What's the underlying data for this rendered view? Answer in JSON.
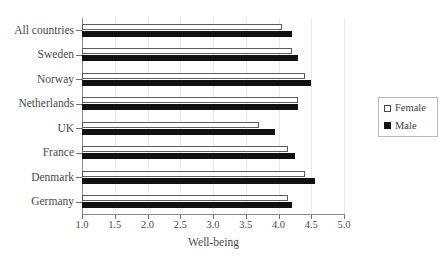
{
  "chart_data": {
    "type": "bar",
    "orientation": "horizontal",
    "title": "",
    "xlabel": "Well-being",
    "ylabel": "",
    "xlim": [
      1.0,
      5.0
    ],
    "xticks": [
      "1.0",
      "1.5",
      "2.0",
      "2.5",
      "3.0",
      "3.5",
      "4.0",
      "4.5",
      "5.0"
    ],
    "xtick_values": [
      1.0,
      1.5,
      2.0,
      2.5,
      3.0,
      3.5,
      4.0,
      4.5,
      5.0
    ],
    "grid": "vertical-light",
    "legend_position": "right-outside",
    "categories": [
      "All countries",
      "Sweden",
      "Norway",
      "Netherlands",
      "UK",
      "France",
      "Denmark",
      "Germany"
    ],
    "series": [
      {
        "name": "Female",
        "color": "#ffffff",
        "edge_color": "#5d5d5d",
        "values": [
          4.05,
          4.2,
          4.4,
          4.3,
          3.7,
          4.15,
          4.4,
          4.15
        ]
      },
      {
        "name": "Male",
        "color": "#111111",
        "edge_color": "#111111",
        "values": [
          4.2,
          4.3,
          4.5,
          4.3,
          3.95,
          4.25,
          4.55,
          4.2
        ]
      }
    ]
  },
  "legend": {
    "entries": [
      {
        "label": "Female",
        "swatch": "open-square-swatch"
      },
      {
        "label": "Male",
        "swatch": "filled-square-swatch"
      }
    ]
  },
  "axis": {
    "title": "Well-being"
  }
}
